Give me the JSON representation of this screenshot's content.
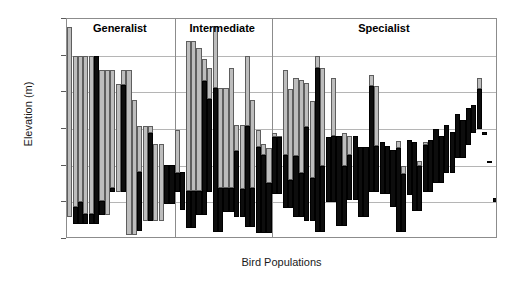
{
  "chart_data": {
    "type": "bar",
    "title": "",
    "xlabel": "Bird Populations",
    "ylabel": "Elevation (m)",
    "ylim": [
      0,
      3000
    ],
    "yticks": [
      0,
      500,
      1000,
      1500,
      2000,
      2500,
      3000
    ],
    "ytick_labels": [
      "0",
      "500",
      "1,000",
      "1,500",
      "2,000",
      "2,500",
      "3,000"
    ],
    "grid": "horizontal",
    "legend": "none",
    "bar_style": "floating range bars; upper segment light gray, lower segment black",
    "groups": [
      {
        "label": "Generalist",
        "count": 17
      },
      {
        "label": "Intermediate",
        "count": 18
      },
      {
        "label": "Specialist",
        "count": 39
      }
    ],
    "series": [
      {
        "name": "Upper range (gray)",
        "color": "#bdbdbd"
      },
      {
        "name": "Lower range (black)",
        "color": "#0d0d0d"
      }
    ],
    "bars": [
      {
        "group": "Generalist",
        "low": 300,
        "mid": 300,
        "high": 2890
      },
      {
        "group": "Generalist",
        "low": 200,
        "mid": 430,
        "high": 2500
      },
      {
        "group": "Generalist",
        "low": 200,
        "mid": 500,
        "high": 2500
      },
      {
        "group": "Generalist",
        "low": 200,
        "mid": 340,
        "high": 2500
      },
      {
        "group": "Generalist",
        "low": 200,
        "mid": 340,
        "high": 2500
      },
      {
        "group": "Generalist",
        "low": 200,
        "mid": 2500,
        "high": 2500
      },
      {
        "group": "Generalist",
        "low": 330,
        "mid": 520,
        "high": 2300
      },
      {
        "group": "Generalist",
        "low": 330,
        "mid": 330,
        "high": 2300
      },
      {
        "group": "Generalist",
        "low": 640,
        "mid": 690,
        "high": 2300
      },
      {
        "group": "Generalist",
        "low": 640,
        "mid": 640,
        "high": 2110
      },
      {
        "group": "Generalist",
        "low": 640,
        "mid": 2100,
        "high": 2300
      },
      {
        "group": "Generalist",
        "low": 60,
        "mid": 60,
        "high": 2300
      },
      {
        "group": "Generalist",
        "low": 60,
        "mid": 60,
        "high": 1900
      },
      {
        "group": "Generalist",
        "low": 110,
        "mid": 920,
        "high": 1540
      },
      {
        "group": "Generalist",
        "low": 240,
        "mid": 240,
        "high": 1540
      },
      {
        "group": "Generalist",
        "low": 240,
        "mid": 1450,
        "high": 1540
      },
      {
        "group": "Generalist",
        "low": 240,
        "mid": 240,
        "high": 1300
      },
      {
        "group": "Generalist",
        "low": 240,
        "mid": 240,
        "high": 1300
      },
      {
        "group": "Generalist",
        "low": 480,
        "mid": 1010,
        "high": 1010
      },
      {
        "group": "Generalist",
        "low": 480,
        "mid": 1010,
        "high": 1010
      },
      {
        "group": "Intermediate",
        "low": 640,
        "mid": 900,
        "high": 1490
      },
      {
        "group": "Intermediate",
        "low": 400,
        "mid": 920,
        "high": 920
      },
      {
        "group": "Intermediate",
        "low": 150,
        "mid": 660,
        "high": 2700
      },
      {
        "group": "Intermediate",
        "low": 150,
        "mid": 660,
        "high": 2700
      },
      {
        "group": "Intermediate",
        "low": 330,
        "mid": 660,
        "high": 2600
      },
      {
        "group": "Intermediate",
        "low": 330,
        "mid": 2150,
        "high": 2450
      },
      {
        "group": "Intermediate",
        "low": 640,
        "mid": 1910,
        "high": 2330
      },
      {
        "group": "Intermediate",
        "low": 90,
        "mid": 2060,
        "high": 2900
      },
      {
        "group": "Intermediate",
        "low": 90,
        "mid": 700,
        "high": 2060
      },
      {
        "group": "Intermediate",
        "low": 370,
        "mid": 700,
        "high": 2060
      },
      {
        "group": "Intermediate",
        "low": 370,
        "mid": 700,
        "high": 2330
      },
      {
        "group": "Intermediate",
        "low": 300,
        "mid": 1200,
        "high": 1550
      },
      {
        "group": "Intermediate",
        "low": 300,
        "mid": 680,
        "high": 1550
      },
      {
        "group": "Intermediate",
        "low": 160,
        "mid": 1540,
        "high": 2500
      },
      {
        "group": "Intermediate",
        "low": 160,
        "mid": 700,
        "high": 1900
      },
      {
        "group": "Intermediate",
        "low": 80,
        "mid": 1260,
        "high": 1480
      },
      {
        "group": "Intermediate",
        "low": 80,
        "mid": 1150,
        "high": 1300
      },
      {
        "group": "Intermediate",
        "low": 80,
        "mid": 760,
        "high": 1240
      },
      {
        "group": "Specialist",
        "low": 620,
        "mid": 1390,
        "high": 1450
      },
      {
        "group": "Specialist",
        "low": 620,
        "mid": 1390,
        "high": 1400
      },
      {
        "group": "Specialist",
        "low": 420,
        "mid": 1140,
        "high": 2300
      },
      {
        "group": "Specialist",
        "low": 420,
        "mid": 800,
        "high": 2050
      },
      {
        "group": "Specialist",
        "low": 300,
        "mid": 1130,
        "high": 2200
      },
      {
        "group": "Specialist",
        "low": 300,
        "mid": 900,
        "high": 2170
      },
      {
        "group": "Specialist",
        "low": 240,
        "mid": 1530,
        "high": 2130
      },
      {
        "group": "Specialist",
        "low": 240,
        "mid": 830,
        "high": 1880
      },
      {
        "group": "Specialist",
        "low": 100,
        "mid": 2330,
        "high": 2490
      },
      {
        "group": "Specialist",
        "low": 100,
        "mid": 1000,
        "high": 2330
      },
      {
        "group": "Specialist",
        "low": 500,
        "mid": 1390,
        "high": 1390
      },
      {
        "group": "Specialist",
        "low": 500,
        "mid": 1400,
        "high": 2190
      },
      {
        "group": "Specialist",
        "low": 180,
        "mid": 1400,
        "high": 1400
      },
      {
        "group": "Specialist",
        "low": 180,
        "mid": 1000,
        "high": 1440
      },
      {
        "group": "Specialist",
        "low": 530,
        "mid": 1140,
        "high": 1400
      },
      {
        "group": "Specialist",
        "low": 530,
        "mid": 1400,
        "high": 1400
      },
      {
        "group": "Specialist",
        "low": 300,
        "mid": 1250,
        "high": 1250
      },
      {
        "group": "Specialist",
        "low": 300,
        "mid": 1250,
        "high": 1250
      },
      {
        "group": "Specialist",
        "low": 640,
        "mid": 2080,
        "high": 2240
      },
      {
        "group": "Specialist",
        "low": 640,
        "mid": 1270,
        "high": 2080
      },
      {
        "group": "Specialist",
        "low": 620,
        "mid": 1320,
        "high": 1320
      },
      {
        "group": "Specialist",
        "low": 620,
        "mid": 1270,
        "high": 1270
      },
      {
        "group": "Specialist",
        "low": 430,
        "mid": 1210,
        "high": 1210
      },
      {
        "group": "Specialist",
        "low": 90,
        "mid": 1240,
        "high": 1330
      },
      {
        "group": "Specialist",
        "low": 90,
        "mid": 880,
        "high": 1000
      },
      {
        "group": "Specialist",
        "low": 600,
        "mid": 1350,
        "high": 1350
      },
      {
        "group": "Specialist",
        "low": 380,
        "mid": 1320,
        "high": 1320
      },
      {
        "group": "Specialist",
        "low": 380,
        "mid": 1000,
        "high": 1060
      },
      {
        "group": "Specialist",
        "low": 640,
        "mid": 1280,
        "high": 1320
      },
      {
        "group": "Specialist",
        "low": 640,
        "mid": 1350,
        "high": 1350
      },
      {
        "group": "Specialist",
        "low": 760,
        "mid": 1500,
        "high": 1500
      },
      {
        "group": "Specialist",
        "low": 760,
        "mid": 1400,
        "high": 1400
      },
      {
        "group": "Specialist",
        "low": 900,
        "mid": 1560,
        "high": 1560
      },
      {
        "group": "Specialist",
        "low": 900,
        "mid": 1460,
        "high": 1460
      },
      {
        "group": "Specialist",
        "low": 1100,
        "mid": 1700,
        "high": 1700
      },
      {
        "group": "Specialist",
        "low": 1100,
        "mid": 1620,
        "high": 1620
      },
      {
        "group": "Specialist",
        "low": 1280,
        "mid": 1780,
        "high": 1780
      },
      {
        "group": "Specialist",
        "low": 1450,
        "mid": 1830,
        "high": 1830
      },
      {
        "group": "Specialist",
        "low": 1500,
        "mid": 2050,
        "high": 2200
      },
      {
        "group": "Specialist",
        "low": 1420,
        "mid": 1460,
        "high": 1460
      },
      {
        "group": "Specialist",
        "low": 1040,
        "mid": 1070,
        "high": 1070
      },
      {
        "group": "Specialist",
        "low": 500,
        "mid": 560,
        "high": 560
      }
    ]
  }
}
